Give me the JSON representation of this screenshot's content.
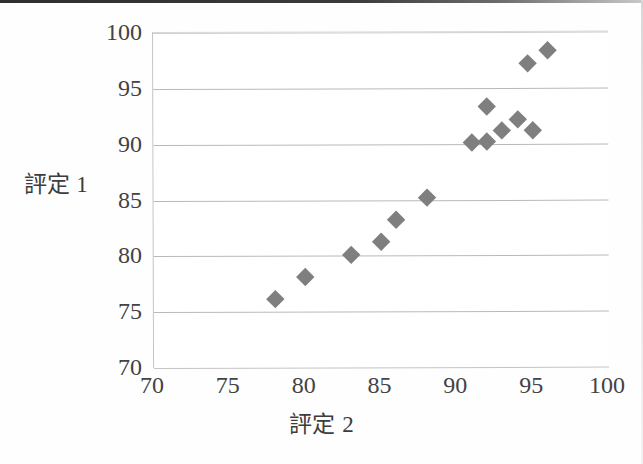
{
  "chart_data": {
    "type": "scatter",
    "title": "",
    "xlabel": "評定 2",
    "ylabel": "評定 1",
    "xlim": [
      70,
      100
    ],
    "ylim": [
      70,
      100
    ],
    "xticks": [
      70,
      75,
      80,
      85,
      90,
      95,
      100
    ],
    "yticks": [
      70,
      75,
      80,
      85,
      90,
      95,
      100
    ],
    "grid": "horizontal",
    "legend": "none",
    "marker": {
      "shape": "diamond",
      "color": "#7f7f7f",
      "size": 13
    },
    "series": [
      {
        "name": "評定1 vs 評定2",
        "points": [
          {
            "x": 78.0,
            "y": 76.1
          },
          {
            "x": 80.0,
            "y": 78.1
          },
          {
            "x": 83.0,
            "y": 80.1
          },
          {
            "x": 85.0,
            "y": 81.2
          },
          {
            "x": 86.0,
            "y": 83.2
          },
          {
            "x": 88.0,
            "y": 85.2
          },
          {
            "x": 91.0,
            "y": 90.1
          },
          {
            "x": 92.0,
            "y": 90.2
          },
          {
            "x": 92.0,
            "y": 93.3
          },
          {
            "x": 93.0,
            "y": 91.2
          },
          {
            "x": 94.0,
            "y": 92.2
          },
          {
            "x": 95.0,
            "y": 91.2
          },
          {
            "x": 94.7,
            "y": 97.2
          },
          {
            "x": 96.0,
            "y": 98.3
          }
        ]
      }
    ]
  }
}
